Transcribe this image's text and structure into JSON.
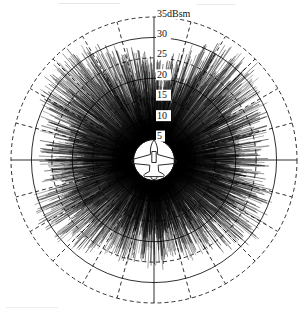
{
  "chart_data": {
    "type": "line",
    "plot_style": "polar",
    "title": "",
    "subtitle": "",
    "xlabel": "",
    "ylabel": "",
    "unit_label": "dBsm",
    "outer_label": "35dBsm",
    "radial_ticks": [
      5,
      10,
      15,
      20,
      25,
      30,
      35
    ],
    "radial_tick_labels": [
      "5",
      "10",
      "15",
      "20",
      "25",
      "30",
      "35dBsm"
    ],
    "rlim": [
      0,
      35
    ],
    "r_inner_blank": 5,
    "angular_unit": "degrees",
    "angular_tick_step": 15,
    "angular_ticks": [
      0,
      15,
      30,
      45,
      60,
      75,
      90,
      105,
      120,
      135,
      150,
      165,
      180,
      195,
      210,
      225,
      240,
      255,
      270,
      285,
      300,
      315,
      330,
      345
    ],
    "theta_zero_location": "N",
    "theta_direction": "clockwise",
    "grid": true,
    "grid_ring_pattern": [
      "solid",
      "dashed"
    ],
    "legend": false,
    "legend_position": "none",
    "center_icon": "aircraft-planform-silhouette",
    "series": [
      {
        "name": "RCS vs azimuth",
        "description": "Monostatic radar cross section of an aircraft over 360 degrees of azimuth, dense spiky returns",
        "lobe_summary": {
          "nose_on_deg": 0,
          "nose_on_peak_dbsm": 27,
          "nose_on_mean_dbsm": 18,
          "broadside_right_deg": 90,
          "broadside_right_peak_dbsm": 35,
          "broadside_right_mean_dbsm": 27,
          "tail_on_deg": 180,
          "tail_on_peak_dbsm": 30,
          "tail_on_mean_dbsm": 21,
          "broadside_left_deg": 270,
          "broadside_left_peak_dbsm": 35,
          "broadside_left_mean_dbsm": 27
        },
        "envelope_mean_dbsm": [
          18.0,
          18.4,
          19.0,
          19.6,
          20.2,
          20.9,
          21.6,
          22.4,
          23.2,
          24.1,
          25.0,
          25.9,
          26.7,
          27.3,
          27.7,
          27.9,
          27.8,
          27.4,
          26.8,
          26.0,
          25.1,
          24.2,
          23.4,
          22.7,
          22.1,
          21.7,
          21.4,
          21.2,
          21.1,
          21.1,
          21.2,
          21.4,
          21.7,
          22.1,
          22.6,
          23.2,
          23.8,
          24.4,
          24.9,
          25.3,
          25.5,
          25.4,
          25.1,
          24.6,
          23.9,
          23.1,
          22.3,
          21.5,
          20.8,
          20.2,
          19.7,
          19.3,
          19.0,
          18.8,
          18.7,
          18.7,
          18.8,
          19.0,
          19.3,
          19.6,
          18.0,
          19.6,
          19.3,
          19.0,
          18.8,
          18.7,
          18.7,
          18.8,
          19.0,
          19.3,
          19.7,
          20.2,
          20.8,
          21.5,
          22.3,
          23.1,
          23.9,
          24.6,
          25.1,
          25.4,
          25.5,
          25.3,
          24.9,
          24.4,
          23.8,
          23.2,
          22.6,
          22.1,
          21.7,
          21.4,
          21.2,
          21.1,
          21.1,
          21.2,
          21.4,
          21.7,
          22.1,
          22.7,
          23.4,
          24.2,
          25.1,
          26.0,
          26.8,
          27.4,
          27.8,
          27.9,
          27.7,
          27.3,
          26.7,
          25.9,
          25.0,
          24.1,
          23.2,
          22.4,
          21.6,
          20.9,
          20.2,
          19.6,
          19.0,
          18.4
        ],
        "envelope_peak_dbsm": [
          26.0,
          26.5,
          27.0,
          27.6,
          28.3,
          29.0,
          29.8,
          30.6,
          31.4,
          32.2,
          33.0,
          33.7,
          34.3,
          34.7,
          35.0,
          35.0,
          34.9,
          34.5,
          34.0,
          33.3,
          32.5,
          31.7,
          30.9,
          30.2,
          29.6,
          29.1,
          28.8,
          28.6,
          28.5,
          28.5,
          28.6,
          28.8,
          29.1,
          29.5,
          30.0,
          30.6,
          31.2,
          31.8,
          32.3,
          32.6,
          32.8,
          32.7,
          32.4,
          31.9,
          31.3,
          30.6,
          29.8,
          29.1,
          28.4,
          27.8,
          27.3,
          26.9,
          26.6,
          26.4,
          26.3,
          26.3,
          26.4,
          26.6,
          26.9,
          27.2,
          26.0,
          27.2,
          26.9,
          26.6,
          26.4,
          26.3,
          26.3,
          26.4,
          26.6,
          26.9,
          27.3,
          27.8,
          28.4,
          29.1,
          29.8,
          30.6,
          31.3,
          31.9,
          32.4,
          32.7,
          32.8,
          32.6,
          32.3,
          31.8,
          31.2,
          30.6,
          30.0,
          29.5,
          29.1,
          28.8,
          28.6,
          28.5,
          28.5,
          28.6,
          28.8,
          29.1,
          29.6,
          30.2,
          30.9,
          31.7,
          32.5,
          33.3,
          34.0,
          34.5,
          34.9,
          35.0,
          35.0,
          34.7,
          34.3,
          33.7,
          33.0,
          32.2,
          31.4,
          30.6,
          29.8,
          29.0,
          28.3,
          27.6,
          27.0,
          26.5
        ]
      }
    ]
  },
  "geometry": {
    "center_x": 154,
    "center_y": 160,
    "outer_radius": 143
  }
}
